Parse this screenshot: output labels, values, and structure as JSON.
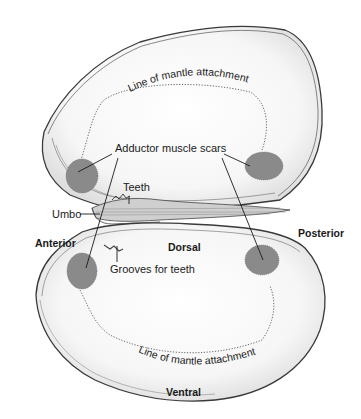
{
  "diagram": {
    "type": "anatomical-illustration",
    "colors": {
      "background": "#ffffff",
      "shell_fill": "#f4f4f4",
      "shell_outline": "#3a3a3a",
      "muscle_scar": "#8a8a8a",
      "leader_line": "#1a1a1a"
    },
    "labels": {
      "mantle_top": "Line of mantle attachment",
      "adductor": "Adductor muscle scars",
      "teeth": "Teeth",
      "umbo": "Umbo",
      "anterior": "Anterior",
      "posterior": "Posterior",
      "dorsal": "Dorsal",
      "grooves": "Grooves for teeth",
      "mantle_bottom": "Line of mantle attachment",
      "ventral": "Ventral"
    }
  }
}
